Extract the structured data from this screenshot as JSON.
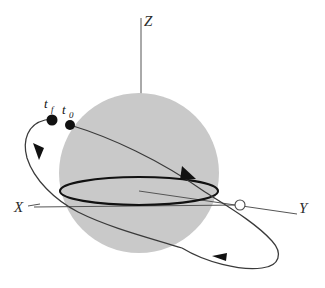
{
  "axes": {
    "x": {
      "label": "X"
    },
    "y": {
      "label": "Y"
    },
    "z": {
      "label": "Z"
    }
  },
  "markers": {
    "initial_time": {
      "symbol": "t",
      "subscript": "0"
    },
    "final_time": {
      "symbol": "t",
      "subscript": "f"
    },
    "node": {
      "name": "ascending-node"
    }
  },
  "colors": {
    "sphere_fill": "#c9c9c9",
    "orbit_stroke": "#3a3a3a",
    "equator_stroke": "#111111",
    "axis_stroke": "#555555",
    "marker_fill": "#111111",
    "background": "#ffffff"
  },
  "geometry": {
    "sphere": {
      "cx": 139,
      "cy": 173,
      "r": 80
    },
    "equator": {
      "cx": 139,
      "cy": 191,
      "rx": 79,
      "ry": 14
    },
    "axis_z_tip": {
      "x": 141,
      "y": 18
    },
    "axis_x_tip": {
      "x": 34,
      "y": 207
    },
    "axis_y_tip": {
      "x": 297,
      "y": 214
    },
    "dot_t0": {
      "x": 70,
      "y": 125,
      "r": 5
    },
    "dot_tf": {
      "x": 52,
      "y": 120,
      "r": 5.5
    },
    "node_point": {
      "x": 240,
      "y": 205,
      "r": 5
    }
  }
}
